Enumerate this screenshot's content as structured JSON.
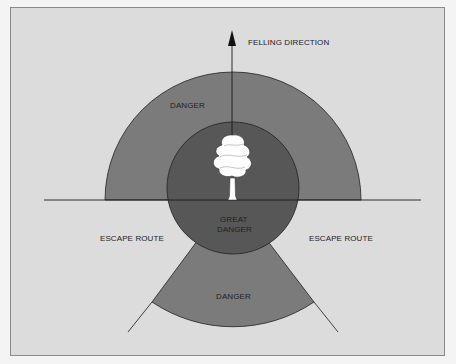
{
  "labels": {
    "felling_direction": "FELLING DIRECTION",
    "danger_top": "DANGER",
    "great_danger_line1": "GREAT",
    "great_danger_line2": "DANGER",
    "escape_left": "ESCAPE ROUTE",
    "escape_right": "ESCAPE ROUTE",
    "danger_bottom": "DANGER"
  },
  "colors": {
    "background": "#dcdcdc",
    "danger": "#7a7a7a",
    "great_danger": "#555555",
    "line": "#1a1a1a",
    "tree": "#ffffff"
  }
}
